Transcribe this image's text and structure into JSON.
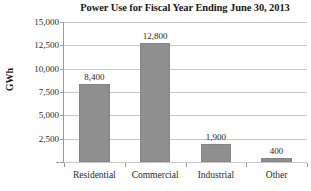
{
  "chart_data": {
    "type": "bar",
    "title": "Power Use for Fiscal Year Ending June 30, 2013",
    "xlabel": "",
    "ylabel": "GWh",
    "categories": [
      "Residential",
      "Commercial",
      "Industrial",
      "Other"
    ],
    "values": [
      8400,
      12800,
      1900,
      400
    ],
    "data_labels": [
      "8,400",
      "12,800",
      "1,900",
      "400"
    ],
    "ylim": [
      0,
      15000
    ],
    "ytick_values": [
      15000,
      12500,
      10000,
      7500,
      5000,
      2500,
      0
    ],
    "ytick_labels": [
      "15,000",
      "12,500",
      "10,000",
      "7,500",
      "5,000",
      "2,500",
      "-"
    ],
    "grid": true,
    "legend": false,
    "legend_position": "none",
    "bar_color": "#8f8f8f",
    "gridline_color": "#c8c8c8",
    "axis_color": "#9a9a9a",
    "background_color": "#ffffff"
  }
}
